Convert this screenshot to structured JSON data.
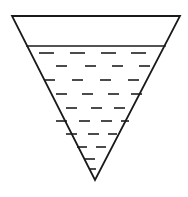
{
  "figure": {
    "type": "line-diagram",
    "canvas": {
      "width": 188,
      "height": 197,
      "background": "#ffffff"
    },
    "colors": {
      "outline": "#1a1a1a",
      "liquid_surface": "#1a1a1a",
      "liquid_hatch": "#2b2b2b",
      "fill": "#ffffff"
    },
    "stroke": {
      "outline_width": 1.8,
      "surface_width": 1.6,
      "hatch_width": 1.7
    }
  },
  "shape": {
    "name": "inverted-triangle",
    "vertices": {
      "top_left": {
        "x": 12,
        "y": 16
      },
      "top_right": {
        "x": 180,
        "y": 16
      },
      "apex": {
        "x": 95,
        "y": 180
      }
    },
    "points_path": "12,16 180,16 95,180",
    "top_width": 168,
    "height": 164
  },
  "liquid": {
    "name": "liquid-body",
    "surface_y": 46,
    "surface_left_x": 27,
    "surface_right_x": 165,
    "surface_width": 138,
    "fill_depth": 134,
    "fill_fraction_of_height": 0.82
  },
  "hatch_rows": [
    {
      "y": 53,
      "dashes": [
        {
          "x": 39,
          "w": 15
        },
        {
          "x": 70,
          "w": 15
        },
        {
          "x": 101,
          "w": 15
        },
        {
          "x": 131,
          "w": 15
        }
      ]
    },
    {
      "y": 66,
      "dashes": [
        {
          "x": 56,
          "w": 11
        },
        {
          "x": 85,
          "w": 11
        },
        {
          "x": 112,
          "w": 11
        },
        {
          "x": 139,
          "w": 11
        }
      ]
    },
    {
      "y": 80,
      "dashes": [
        {
          "x": 44,
          "w": 11
        },
        {
          "x": 72,
          "w": 11
        },
        {
          "x": 100,
          "w": 11
        },
        {
          "x": 128,
          "w": 11
        }
      ]
    },
    {
      "y": 94,
      "dashes": [
        {
          "x": 56,
          "w": 11
        },
        {
          "x": 82,
          "w": 11
        },
        {
          "x": 108,
          "w": 11
        },
        {
          "x": 131,
          "w": 11
        }
      ]
    },
    {
      "y": 108,
      "dashes": [
        {
          "x": 66,
          "w": 11
        },
        {
          "x": 91,
          "w": 11
        },
        {
          "x": 114,
          "w": 11
        }
      ]
    },
    {
      "y": 121,
      "dashes": [
        {
          "x": 56,
          "w": 11
        },
        {
          "x": 79,
          "w": 11
        },
        {
          "x": 101,
          "w": 11
        },
        {
          "x": 121,
          "w": 8
        }
      ]
    },
    {
      "y": 134,
      "dashes": [
        {
          "x": 66,
          "w": 11
        },
        {
          "x": 88,
          "w": 11
        },
        {
          "x": 108,
          "w": 9
        }
      ]
    },
    {
      "y": 147,
      "dashes": [
        {
          "x": 77,
          "w": 10
        },
        {
          "x": 96,
          "w": 10
        }
      ]
    },
    {
      "y": 159,
      "dashes": [
        {
          "x": 85,
          "w": 10
        }
      ]
    },
    {
      "y": 169,
      "dashes": [
        {
          "x": 90,
          "w": 6
        }
      ]
    }
  ]
}
